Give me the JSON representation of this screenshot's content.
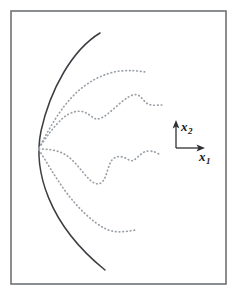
{
  "figure": {
    "kind": "scientific-line-diagram",
    "background_color": "#ffffff",
    "frame": {
      "name": "figure-border",
      "stroke_color": "#6f7276",
      "x": 11,
      "y": 11,
      "width": 215,
      "height": 273
    },
    "axes_indicator": {
      "name": "coordinate-axes-indicator",
      "origin_x": 176,
      "origin_y": 148,
      "vertical_tip_y": 122,
      "horizontal_tip_x": 205,
      "stroke_color": "#2e3034",
      "labels": {
        "vertical": {
          "var": "x",
          "sub": "2"
        },
        "horizontal": {
          "var": "x",
          "sub": "1"
        }
      }
    },
    "solid_curve": {
      "name": "solid-arc-curve",
      "style": "solid",
      "stroke_color": "#3b3d42",
      "path": "M 100 33 C 72 50 50 90 41 131 C 33 170 48 224 105 270"
    },
    "dotted_curves": [
      {
        "name": "dotted-curve-1",
        "style": "dotted",
        "stroke_color": "#9aa0a6",
        "path": "M 39 148 C 48 131 58 112 72 97 C 86 82 104 73 120 71 C 130 70 139 71 145 72"
      },
      {
        "name": "dotted-curve-2",
        "style": "dotted",
        "stroke_color": "#9aa0a6",
        "path": "M 39 148 C 47 136 55 125 63 118 C 70 112 78 110 84 112 C 90 114 93 119 97 119 C 103 119 110 112 118 105 C 126 98 133 93 138 95 C 142 97 144 102 148 104 C 152 106 158 105 162 105"
      },
      {
        "name": "dotted-curve-3",
        "style": "dotted",
        "stroke_color": "#9aa0a6",
        "path": "M 39 149 C 48 149 58 150 66 155 C 75 161 82 172 89 179 C 94 184 99 186 103 181 C 107 176 108 165 112 160 C 116 155 123 156 129 160 C 135 164 140 151 148 151 C 154 151 158 153 160 155"
      },
      {
        "name": "dotted-curve-4",
        "style": "dotted",
        "stroke_color": "#9aa0a6",
        "path": "M 39 150 C 46 161 55 177 66 192 C 78 208 92 222 106 229 C 116 234 128 231 136 230"
      }
    ]
  }
}
